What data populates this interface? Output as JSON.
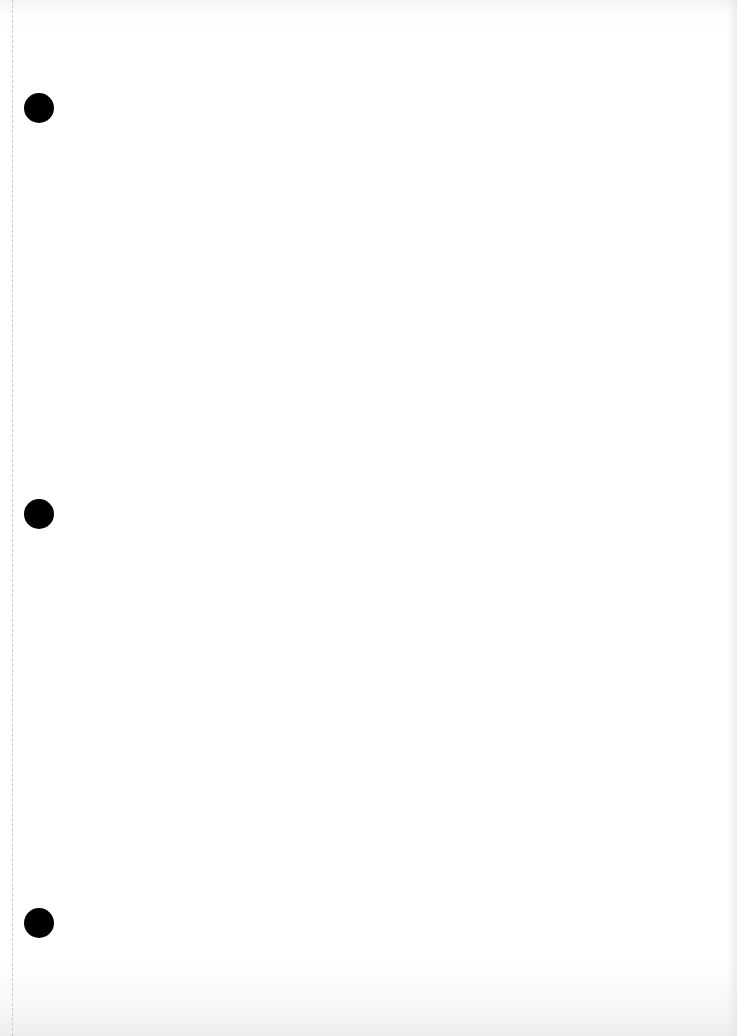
{
  "document": {
    "type": "blank hole-punched sheet",
    "background_color": "#ffffff",
    "margin_line": {
      "style": "dashed",
      "x": 12,
      "color": "#c9c9c9"
    },
    "punch_holes": [
      {
        "cx": 39,
        "cy": 108,
        "diameter": 30,
        "color": "#000000"
      },
      {
        "cx": 39,
        "cy": 514,
        "diameter": 30,
        "color": "#000000"
      },
      {
        "cx": 39,
        "cy": 923,
        "diameter": 30,
        "color": "#000000"
      }
    ]
  }
}
